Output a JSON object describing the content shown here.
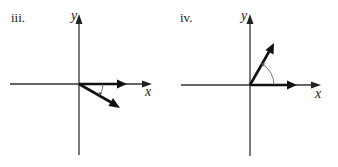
{
  "panels": [
    {
      "label": "iii.",
      "x_axis_label": "x",
      "y_axis_label": "y",
      "vectors": [
        {
          "name": "unit-x-vector",
          "direction_deg": 0
        },
        {
          "name": "rotated-vector",
          "direction_deg": -30
        }
      ],
      "angle_arc": "clockwise"
    },
    {
      "label": "iv.",
      "x_axis_label": "x",
      "y_axis_label": "y",
      "vectors": [
        {
          "name": "unit-x-vector",
          "direction_deg": 0
        },
        {
          "name": "rotated-vector",
          "direction_deg": 60
        }
      ],
      "angle_arc": "counterclockwise"
    }
  ]
}
